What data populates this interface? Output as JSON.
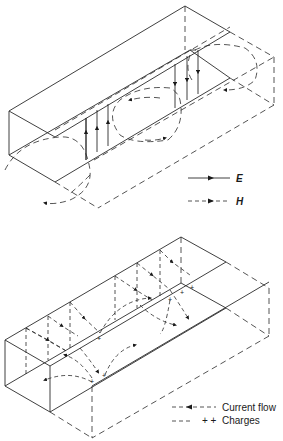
{
  "figure": {
    "top_panel": {
      "description": "Rectangular waveguide cut-away showing TE10 mode fields",
      "legend": [
        {
          "symbol": "solid-line-with-arrow",
          "label": "E"
        },
        {
          "symbol": "dashed-line-with-arrow",
          "label": "H"
        }
      ]
    },
    "bottom_panel": {
      "description": "Rectangular waveguide showing wall current flow and charges",
      "legend": [
        {
          "symbol": "dashed-line-with-arrow",
          "label": "Current flow"
        },
        {
          "symbol": "dashes-with-plus",
          "prefix": "+ +",
          "label": "Charges"
        }
      ],
      "charge_marks": [
        "+",
        "+",
        "+",
        "+",
        "+",
        "+"
      ]
    },
    "colors": {
      "line": "#2a2a2a",
      "background": "#ffffff"
    }
  }
}
